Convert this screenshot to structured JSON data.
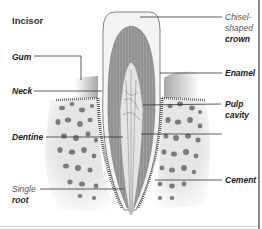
{
  "diagram": {
    "title": "Incisor",
    "labels": {
      "gum": "Gum",
      "neck": "Neck",
      "dentine": "Dentine",
      "single_root_line1": "Single",
      "single_root_line2": "root",
      "chisel_line1": "Chisel-",
      "chisel_line2": "shaped",
      "chisel_line3": "crown",
      "enamel": "Enamel",
      "pulp_line1": "Pulp",
      "pulp_line2": "cavity",
      "cement": "Cement"
    },
    "colors": {
      "enamel": "#f4f4f4",
      "dentine": "#9a9a9a",
      "gum": "#c8c8c8",
      "bone": "#e8e8e8",
      "bone_pores": "#6a6a6a",
      "leader_lines": "#333333"
    }
  }
}
